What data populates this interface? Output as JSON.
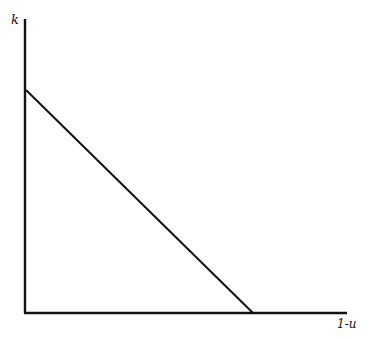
{
  "diagram": {
    "type": "line-diagram",
    "y_axis_label": "k",
    "x_axis_label": "1-u",
    "line_color": "#111111",
    "background": "#ffffff",
    "axes": {
      "origin": [
        25,
        313
      ],
      "y_top": [
        25,
        19
      ],
      "x_end": [
        347,
        313
      ]
    },
    "line": {
      "start": [
        26,
        90
      ],
      "end": [
        253,
        313
      ],
      "description": "downward-sloping straight line from the k-axis intercept to the 1-u-axis intercept"
    }
  }
}
